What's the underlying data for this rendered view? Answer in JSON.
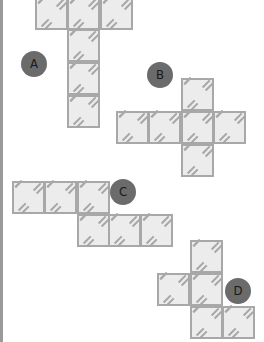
{
  "figure": {
    "colors": {
      "cell_fill": "#ececec",
      "cell_border": "#a8a8a8",
      "label_fill": "#6b6b6b",
      "label_text": "#1a1a1a"
    },
    "cell_size": 32,
    "nets": [
      {
        "label": "A",
        "label_pos": [
          21,
          51
        ],
        "cells": [
          [
            35,
            -3
          ],
          [
            67,
            -3
          ],
          [
            100,
            -3
          ],
          [
            67,
            29
          ],
          [
            67,
            62
          ],
          [
            67,
            95
          ]
        ]
      },
      {
        "label": "B",
        "label_pos": [
          147,
          62
        ],
        "cells": [
          [
            181,
            78
          ],
          [
            116,
            111
          ],
          [
            148,
            111
          ],
          [
            181,
            111
          ],
          [
            213,
            111
          ],
          [
            181,
            144
          ]
        ]
      },
      {
        "label": "C",
        "label_pos": [
          110,
          179
        ],
        "cells": [
          [
            12,
            181
          ],
          [
            44,
            181
          ],
          [
            77,
            181
          ],
          [
            77,
            214
          ],
          [
            108,
            214
          ],
          [
            140,
            214
          ]
        ]
      },
      {
        "label": "D",
        "label_pos": [
          225,
          278
        ],
        "cells": [
          [
            190,
            240
          ],
          [
            157,
            273
          ],
          [
            190,
            273
          ],
          [
            190,
            306
          ],
          [
            222,
            306
          ]
        ]
      }
    ]
  }
}
